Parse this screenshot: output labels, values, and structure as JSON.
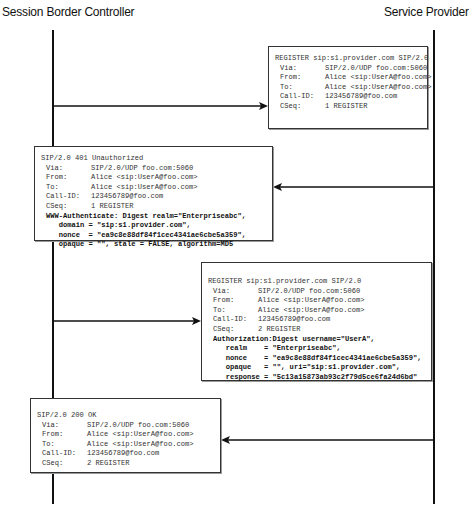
{
  "actors": {
    "left": "Session Border Controller",
    "right": "Service Provider"
  },
  "messages": [
    {
      "direction": "right",
      "start_line": "REGISTER sip:s1.provider.com SIP/2.0",
      "headers": [
        {
          "name": "Via:",
          "value": "SIP/2.0/UDP foo.com:5060"
        },
        {
          "name": "From:",
          "value": "Alice <sip:UserA@foo.com>"
        },
        {
          "name": "To:",
          "value": "Alice <sip:UserA@foo.com>"
        },
        {
          "name": "Call-ID:",
          "value": "123456789@foo.com"
        },
        {
          "name": "CSeq:",
          "value": "1 REGISTER"
        }
      ],
      "auth_lines": []
    },
    {
      "direction": "left",
      "start_line": "SIP/2.0 401 Unauthorized",
      "headers": [
        {
          "name": "Via:",
          "value": "SIP/2.0/UDP foo.com:5060"
        },
        {
          "name": "From:",
          "value": "Alice <sip:UserA@foo.com>"
        },
        {
          "name": "To:",
          "value": "Alice <sip:UserA@foo.com>"
        },
        {
          "name": "Call-ID:",
          "value": "123456789@foo.com"
        },
        {
          "name": "CSeq:",
          "value": "1 REGISTER"
        }
      ],
      "auth_lines": [
        "WWW-Authenticate: Digest realm=\"Enterpriseabc\",",
        "   domain = \"sip:s1.provider.com\",",
        "   nonce  = \"ea9c8e88df84f1cec4341ae6cbe5a359\",",
        "   opaque = \"\", stale = FALSE, algorithm=MD5"
      ]
    },
    {
      "direction": "right",
      "start_line": "REGISTER sip:s1.provider.com SIP/2.0",
      "headers": [
        {
          "name": "Via:",
          "value": "SIP/2.0/UDP foo.com:5060"
        },
        {
          "name": "From:",
          "value": "Alice <sip:UserA@foo.com>"
        },
        {
          "name": "To:",
          "value": "Alice <sip:UserA@foo.com>"
        },
        {
          "name": "Call-ID:",
          "value": "123456789@foo.com"
        },
        {
          "name": "CSeq:",
          "value": "2 REGISTER"
        }
      ],
      "auth_lines": [
        "Authorization:Digest username=\"UserA\",",
        "   realm    = \"Enterpriseabc\",",
        "   nonce    = \"ea9c8e88df84f1cec4341ae6cbe5a359\",",
        "   opaque   = \"\", uri=\"sip:s1.provider.com\",",
        "   response = \"5c13a15873ab93c2f79d5ce6fa24d6bd\""
      ]
    },
    {
      "direction": "left",
      "start_line": "SIP/2.0 200 OK",
      "headers": [
        {
          "name": "Via:",
          "value": "SIP/2.0/UDP foo.com:5060"
        },
        {
          "name": "From:",
          "value": "Alice <sip:UserA@foo.com>"
        },
        {
          "name": "To:",
          "value": "Alice <sip:UserA@foo.com>"
        },
        {
          "name": "Call-ID:",
          "value": "123456789@foo.com"
        },
        {
          "name": "CSeq:",
          "value": "2 REGISTER"
        }
      ],
      "auth_lines": []
    }
  ]
}
